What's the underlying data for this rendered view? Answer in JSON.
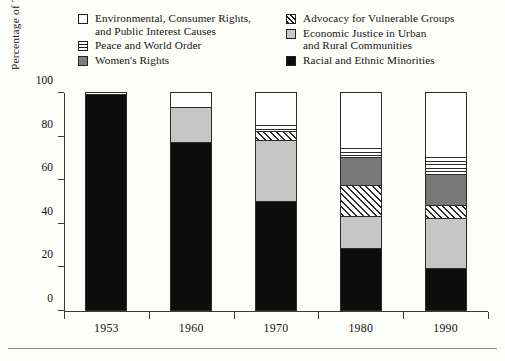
{
  "legend": {
    "columns": [
      {
        "entries": [
          {
            "label": "Environmental, Consumer Rights,\nand Public Interest Causes",
            "pattern": "white-square",
            "color": "#ffffff"
          },
          {
            "label": "Peace and World Order",
            "pattern": "horizontal-stripes",
            "color": "#ffffff"
          },
          {
            "label": "Women's Rights",
            "pattern": "dark-gray-solid",
            "color": "#787878"
          }
        ]
      },
      {
        "entries": [
          {
            "label": "Advocacy for Vulnerable Groups",
            "pattern": "diagonal-hatch",
            "color": "#ffffff"
          },
          {
            "label": "Economic Justice in Urban\nand Rural Communities",
            "pattern": "light-gray-solid",
            "color": "#c6c6c6"
          },
          {
            "label": "Racial and Ethnic Minorities",
            "pattern": "black-solid",
            "color": "#0d0d0d"
          }
        ]
      }
    ]
  },
  "chart_data": {
    "type": "bar",
    "subtype": "stacked-percentage",
    "title": "",
    "xlabel": "",
    "ylabel": "Percentage of Total Grant Dollars",
    "categories": [
      "1953",
      "1960",
      "1970",
      "1980",
      "1990"
    ],
    "ylim": [
      0,
      100
    ],
    "yticks": [
      0,
      20,
      40,
      60,
      80,
      100
    ],
    "ytick_labels": [
      "0",
      "20",
      "40",
      "60",
      "80",
      "100"
    ],
    "grid": false,
    "legend_position": "top",
    "series": [
      {
        "name": "Racial and Ethnic Minorities",
        "pattern": "black-solid",
        "values": [
          99,
          77,
          50,
          28,
          19
        ]
      },
      {
        "name": "Economic Justice in Urban and Rural Communities",
        "pattern": "light-gray-solid",
        "values": [
          0,
          16,
          28,
          15,
          23
        ]
      },
      {
        "name": "Advocacy for Vulnerable Groups",
        "pattern": "diagonal-hatch",
        "values": [
          0,
          0,
          4,
          14,
          6
        ]
      },
      {
        "name": "Women's Rights",
        "pattern": "dark-gray-solid",
        "values": [
          0,
          0,
          0,
          13,
          14
        ]
      },
      {
        "name": "Peace and World Order",
        "pattern": "horizontal-stripes",
        "values": [
          1,
          0,
          3,
          4,
          8
        ]
      },
      {
        "name": "Environmental, Consumer Rights, and Public Interest Causes",
        "pattern": "white-square",
        "values": [
          0,
          7,
          15,
          26,
          30
        ]
      }
    ],
    "stacks": [
      {
        "category": "1953",
        "segments": [
          {
            "name": "Racial and Ethnic Minorities",
            "pattern": "black-solid",
            "value": 99
          },
          {
            "name": "Peace and World Order",
            "pattern": "horizontal-stripes",
            "value": 1
          }
        ]
      },
      {
        "category": "1960",
        "segments": [
          {
            "name": "Racial and Ethnic Minorities",
            "pattern": "black-solid",
            "value": 77
          },
          {
            "name": "Economic Justice in Urban and Rural Communities",
            "pattern": "light-gray-solid",
            "value": 16
          },
          {
            "name": "Environmental, Consumer Rights, and Public Interest Causes",
            "pattern": "white-square",
            "value": 7
          }
        ]
      },
      {
        "category": "1970",
        "segments": [
          {
            "name": "Racial and Ethnic Minorities",
            "pattern": "black-solid",
            "value": 50
          },
          {
            "name": "Economic Justice in Urban and Rural Communities",
            "pattern": "light-gray-solid",
            "value": 28
          },
          {
            "name": "Advocacy for Vulnerable Groups",
            "pattern": "diagonal-hatch",
            "value": 4
          },
          {
            "name": "Peace and World Order",
            "pattern": "horizontal-stripes",
            "value": 3
          },
          {
            "name": "Environmental, Consumer Rights, and Public Interest Causes",
            "pattern": "white-square",
            "value": 15
          }
        ]
      },
      {
        "category": "1980",
        "segments": [
          {
            "name": "Racial and Ethnic Minorities",
            "pattern": "black-solid",
            "value": 28
          },
          {
            "name": "Economic Justice in Urban and Rural Communities",
            "pattern": "light-gray-solid",
            "value": 15
          },
          {
            "name": "Advocacy for Vulnerable Groups",
            "pattern": "diagonal-hatch",
            "value": 14
          },
          {
            "name": "Women's Rights",
            "pattern": "dark-gray-solid",
            "value": 13
          },
          {
            "name": "Peace and World Order",
            "pattern": "horizontal-stripes",
            "value": 4
          },
          {
            "name": "Environmental, Consumer Rights, and Public Interest Causes",
            "pattern": "white-square",
            "value": 26
          }
        ]
      },
      {
        "category": "1990",
        "segments": [
          {
            "name": "Racial and Ethnic Minorities",
            "pattern": "black-solid",
            "value": 19
          },
          {
            "name": "Economic Justice in Urban and Rural Communities",
            "pattern": "light-gray-solid",
            "value": 23
          },
          {
            "name": "Advocacy for Vulnerable Groups",
            "pattern": "diagonal-hatch",
            "value": 6
          },
          {
            "name": "Women's Rights",
            "pattern": "dark-gray-solid",
            "value": 14
          },
          {
            "name": "Peace and World Order",
            "pattern": "horizontal-stripes",
            "value": 8
          },
          {
            "name": "Environmental, Consumer Rights, and Public Interest Causes",
            "pattern": "white-square",
            "value": 30
          }
        ]
      }
    ]
  }
}
